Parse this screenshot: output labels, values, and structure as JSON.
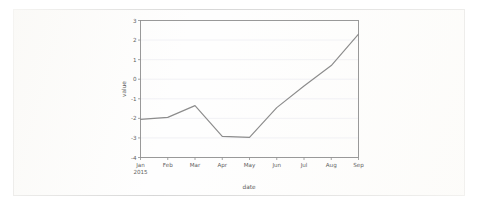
{
  "figure": {
    "background_color": "#ffffff",
    "frame_color": "#c9c9c9",
    "line_color": "#8c8c8c",
    "grid_color": "#ededf2",
    "axis_color": "#8f8f8f"
  },
  "chart_data": {
    "type": "line",
    "title": "",
    "xlabel": "date",
    "ylabel": "value",
    "grid": true,
    "legend": false,
    "ylim": [
      -4,
      3
    ],
    "yticks": [
      3,
      2,
      1,
      0,
      -1,
      -2,
      -3,
      -4
    ],
    "yticklabels": [
      "3",
      "2",
      "1",
      "0",
      "-1",
      "-2",
      "-3",
      "-4"
    ],
    "categories": [
      "Jan",
      "Feb",
      "Mar",
      "Apr",
      "May",
      "Jun",
      "Jul",
      "Aug",
      "Sep"
    ],
    "xticklabels": [
      "Jan",
      "Feb",
      "Mar",
      "Apr",
      "May",
      "Jun",
      "Jul",
      "Aug",
      "Sep"
    ],
    "x_year_label": "2015",
    "series": [
      {
        "name": "value",
        "color": "#8c8c8c",
        "values": [
          -2.05,
          -1.95,
          -1.35,
          -2.92,
          -2.97,
          -1.45,
          -0.35,
          0.7,
          2.3
        ]
      }
    ]
  }
}
